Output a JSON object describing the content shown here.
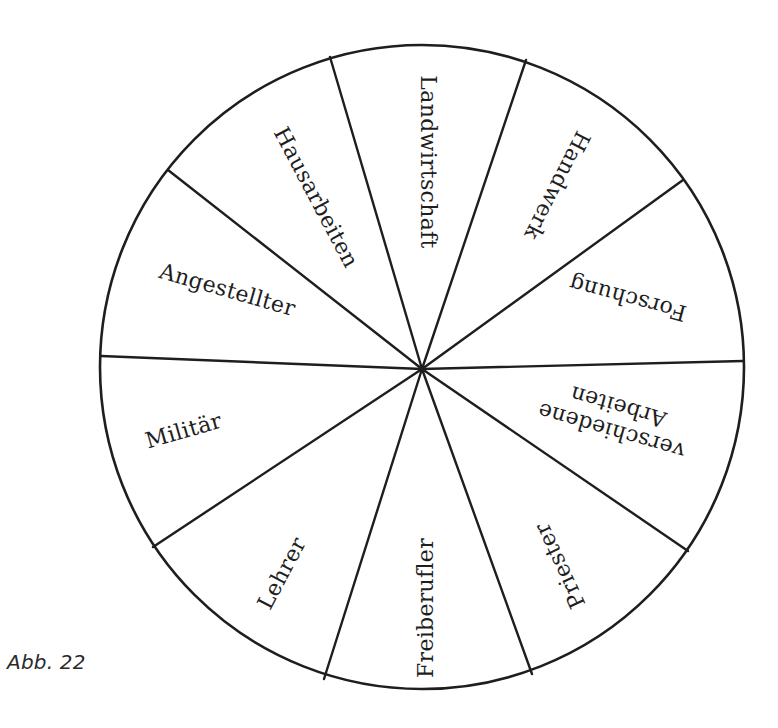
{
  "figure": {
    "caption": "Abb. 22",
    "type": "circle divided into 10 labeled sectors",
    "stroke_color": "#1e1e1e",
    "background_color": "#ffffff",
    "circle": {
      "cx": 422,
      "cy": 367,
      "r": 322
    },
    "hub": {
      "x": 422,
      "y": 369
    },
    "spoke_endpoints": [
      {
        "x": 330,
        "y": 57
      },
      {
        "x": 526,
        "y": 60
      },
      {
        "x": 683,
        "y": 180
      },
      {
        "x": 743,
        "y": 361
      },
      {
        "x": 688,
        "y": 551
      },
      {
        "x": 532,
        "y": 674
      },
      {
        "x": 324,
        "y": 679
      },
      {
        "x": 153,
        "y": 547
      },
      {
        "x": 101,
        "y": 356
      },
      {
        "x": 168,
        "y": 170
      }
    ],
    "sectors": [
      {
        "label": "Landwirtschaft",
        "x": 427,
        "y": 162,
        "rotate": 90
      },
      {
        "label": "Handwerk",
        "x": 556,
        "y": 185,
        "rotate": 117
      },
      {
        "label": "Forschung",
        "x": 628,
        "y": 297,
        "rotate": 195
      },
      {
        "label": "verschiedene",
        "label_line2": "Arbeiten",
        "x": 615,
        "y": 418,
        "rotate": 196
      },
      {
        "label": "Priester",
        "x": 561,
        "y": 565,
        "rotate": 245
      },
      {
        "label": "Freiberufler",
        "x": 427,
        "y": 608,
        "rotate": -90
      },
      {
        "label": "Lehrer",
        "x": 283,
        "y": 574,
        "rotate": -62
      },
      {
        "label": "Militär",
        "x": 184,
        "y": 432,
        "rotate": -16
      },
      {
        "label": "Angestellter",
        "x": 227,
        "y": 291,
        "rotate": 16
      },
      {
        "label": "Hausarbeiten",
        "x": 315,
        "y": 198,
        "rotate": 62
      }
    ]
  }
}
